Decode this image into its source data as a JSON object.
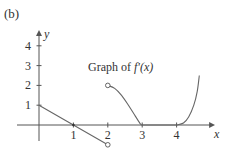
{
  "figure": {
    "panel_label": "(b)",
    "annotation": "Graph of f'(x)"
  },
  "chart_data": {
    "type": "line",
    "title": "Graph of f'(x)",
    "panel": "(b)",
    "xlabel": "x",
    "ylabel": "y",
    "xlim": [
      0,
      4.8
    ],
    "ylim": [
      -0.75,
      4.6
    ],
    "x_ticks": [
      1,
      2,
      3,
      4
    ],
    "y_ticks": [
      1,
      2,
      3,
      4
    ],
    "grid": false,
    "legend": null,
    "colors": {
      "axis": "#555555",
      "curve": "#666666",
      "text": "#333333"
    },
    "series": [
      {
        "name": "segment-1 (line from (0,1) to (2,-1), open at x=2)",
        "kind": "line",
        "points": [
          [
            0,
            1
          ],
          [
            1,
            0
          ],
          [
            2,
            -1
          ]
        ],
        "end_markers": [
          {
            "x": 2,
            "y": -1,
            "style": "open"
          }
        ],
        "vertex_markers": [
          {
            "x": 1,
            "y": 0,
            "style": "filled-small"
          }
        ]
      },
      {
        "name": "segment-2 (decreasing S-curve from (2,2) open to (3,0))",
        "kind": "curve",
        "points": [
          [
            2,
            2
          ],
          [
            2.2,
            1.85
          ],
          [
            2.4,
            1.5
          ],
          [
            2.6,
            1.0
          ],
          [
            2.8,
            0.45
          ],
          [
            2.95,
            0.05
          ],
          [
            3,
            0
          ]
        ],
        "end_markers": [
          {
            "x": 2,
            "y": 2,
            "style": "open"
          }
        ]
      },
      {
        "name": "segment-3 (flat zero from x=3 to x=4)",
        "kind": "line",
        "points": [
          [
            3,
            0
          ],
          [
            4,
            0
          ]
        ]
      },
      {
        "name": "segment-4 (rapidly increasing after x=4)",
        "kind": "curve",
        "points": [
          [
            4,
            0
          ],
          [
            4.2,
            0.1
          ],
          [
            4.35,
            0.4
          ],
          [
            4.5,
            1.0
          ],
          [
            4.6,
            1.7
          ],
          [
            4.66,
            2.5
          ]
        ]
      }
    ]
  }
}
